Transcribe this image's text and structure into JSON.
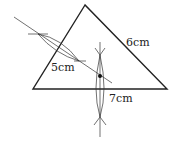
{
  "diagram": {
    "labels": {
      "side_right": "6cm",
      "side_left": "5cm",
      "side_base": "7cm"
    },
    "triangle": {
      "apex": [
        85,
        5
      ],
      "left": [
        33,
        89
      ],
      "right": [
        167,
        89
      ]
    },
    "colors": {
      "stroke": "#222222",
      "background": "#ffffff"
    }
  }
}
